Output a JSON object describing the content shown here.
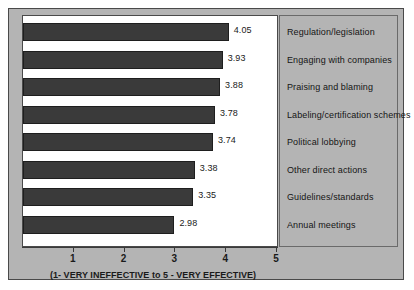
{
  "chart_data": {
    "type": "bar",
    "orientation": "horizontal",
    "title": "",
    "subtitle": "",
    "xlabel": "(1- VERY INEFFECTIVE to 5 - VERY EFFECTIVE)",
    "ylabel": "",
    "xlim": [
      0,
      5
    ],
    "grid": false,
    "legend_position": "right-panel",
    "xticks": [
      "1",
      "2",
      "3",
      "4",
      "5"
    ],
    "xtick_values": [
      1,
      2,
      3,
      4,
      5
    ],
    "categories": [
      "Regulation/legislation",
      "Engaging with companies",
      "Praising and blaming",
      "Labeling/certification schemes",
      "Political lobbying",
      "Other direct actions",
      "Guidelines/standards",
      "Annual meetings"
    ],
    "values": [
      4.05,
      3.93,
      3.88,
      3.78,
      3.74,
      3.38,
      3.35,
      2.98
    ],
    "value_labels": [
      "4.05",
      "3.93",
      "3.88",
      "3.78",
      "3.74",
      "3.38",
      "3.35",
      "2.98"
    ],
    "bar_color": "#3a3a3a",
    "panel_color": "#b4b4b4",
    "plot_background": "#ffffff"
  }
}
